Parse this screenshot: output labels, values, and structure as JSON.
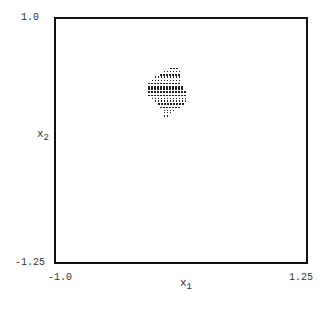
{
  "chart_data": {
    "type": "scatter",
    "title": "",
    "xlabel": "x1",
    "ylabel": "x2",
    "xlim": [
      -1.0,
      1.25
    ],
    "ylim": [
      -1.25,
      1.0
    ],
    "x_ticks": [
      "-1.0",
      "1.25"
    ],
    "y_ticks": [
      "1.0",
      "-1.25"
    ],
    "grid": false,
    "legend": null,
    "rows": [
      {
        "y": 0.55,
        "x_from": 0.03,
        "x_to": 0.11
      },
      {
        "y": 0.52,
        "x_from": -0.03,
        "x_to": 0.11
      },
      {
        "y": 0.49,
        "x_from": -0.06,
        "x_to": 0.11
      },
      {
        "y": 0.47,
        "x_from": -0.11,
        "x_to": 0.11
      },
      {
        "y": 0.44,
        "x_from": -0.14,
        "x_to": 0.11
      },
      {
        "y": 0.41,
        "x_from": -0.17,
        "x_to": 0.11
      },
      {
        "y": 0.38,
        "x_from": -0.17,
        "x_to": 0.14
      },
      {
        "y": 0.36,
        "x_from": -0.17,
        "x_to": 0.14
      },
      {
        "y": 0.33,
        "x_from": -0.17,
        "x_to": 0.17
      },
      {
        "y": 0.3,
        "x_from": -0.17,
        "x_to": 0.17
      },
      {
        "y": 0.27,
        "x_from": -0.14,
        "x_to": 0.17
      },
      {
        "y": 0.25,
        "x_from": -0.11,
        "x_to": 0.17
      },
      {
        "y": 0.22,
        "x_from": -0.08,
        "x_to": 0.14
      },
      {
        "y": 0.19,
        "x_from": -0.06,
        "x_to": 0.11
      },
      {
        "y": 0.16,
        "x_from": -0.03,
        "x_to": 0.06
      },
      {
        "y": 0.14,
        "x_from": -0.03,
        "x_to": 0.03
      },
      {
        "y": 0.11,
        "x_from": -0.03,
        "x_to": 0.01
      }
    ],
    "grid_step": 0.027
  },
  "axes": {
    "y_top": "1.0",
    "y_bottom": "-1.25",
    "x_left": "-1.0",
    "x_right": "1.25",
    "x_label_main": "x",
    "x_label_sub": "1",
    "y_label_main": "x",
    "y_label_sub": "2"
  },
  "caption": "Fig. 2.1  The region ... of ... (caption partially cut off)"
}
